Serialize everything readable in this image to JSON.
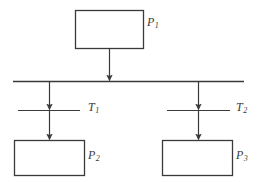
{
  "diagram": {
    "type": "petri-net-fragment",
    "stroke_color": "#3a3a3a",
    "fill_color": "#ffffff",
    "background_color": "#ffffff",
    "places": [
      {
        "id": "P1",
        "label": "P",
        "subscript": "1",
        "shape": "rectangle",
        "x": 75,
        "y": 10,
        "width": 68,
        "height": 38,
        "label_x": 147,
        "label_y": 16
      },
      {
        "id": "P2",
        "label": "P",
        "subscript": "2",
        "shape": "rectangle",
        "x": 14,
        "y": 140,
        "width": 70,
        "height": 35,
        "label_x": 88,
        "label_y": 149
      },
      {
        "id": "P3",
        "label": "P",
        "subscript": "3",
        "shape": "rectangle",
        "x": 162,
        "y": 140,
        "width": 70,
        "height": 35,
        "label_x": 236,
        "label_y": 149
      }
    ],
    "transitions": [
      {
        "id": "T1",
        "label": "T",
        "subscript": "1",
        "shape": "horizontal-bar",
        "x1": 18,
        "x2": 80,
        "y": 110,
        "label_x": 88,
        "label_y": 101
      },
      {
        "id": "T2",
        "label": "T",
        "subscript": "2",
        "shape": "horizontal-bar",
        "x1": 167,
        "x2": 230,
        "y": 110,
        "label_x": 236,
        "label_y": 101
      }
    ],
    "sync_bar": {
      "id": "synchronization-bar",
      "x1": 13,
      "x2": 244,
      "y": 81
    },
    "arcs": [
      {
        "id": "arc-p1-to-bar",
        "from": "P1",
        "to": "synchronization-bar",
        "x": 109,
        "y1": 48,
        "y2": 81,
        "arrowhead": "end"
      },
      {
        "id": "arc-bar-to-t1",
        "from": "synchronization-bar",
        "to": "T1",
        "x": 49,
        "y1": 81,
        "y2": 110,
        "arrowhead": "end"
      },
      {
        "id": "arc-t1-to-p2",
        "from": "T1",
        "to": "P2",
        "x": 49,
        "y1": 110,
        "y2": 140,
        "arrowhead": "end"
      },
      {
        "id": "arc-bar-to-t2",
        "from": "synchronization-bar",
        "to": "T2",
        "x": 198,
        "y1": 81,
        "y2": 110,
        "arrowhead": "end"
      },
      {
        "id": "arc-t2-to-p3",
        "from": "T2",
        "to": "P3",
        "x": 198,
        "y1": 110,
        "y2": 140,
        "arrowhead": "end"
      }
    ]
  }
}
